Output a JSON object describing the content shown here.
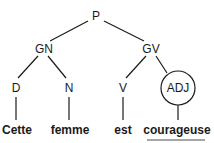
{
  "tree": {
    "root": "P",
    "nodes": {
      "p": "P",
      "gn": "GN",
      "gv": "GV",
      "d": "D",
      "n": "N",
      "v": "V",
      "adj": "ADJ"
    },
    "words": {
      "w1": "Cette",
      "w2": "femme",
      "w3": "est",
      "w4": "courageuse"
    },
    "highlighted_node": "ADJ",
    "underlined_word": "courageuse"
  }
}
